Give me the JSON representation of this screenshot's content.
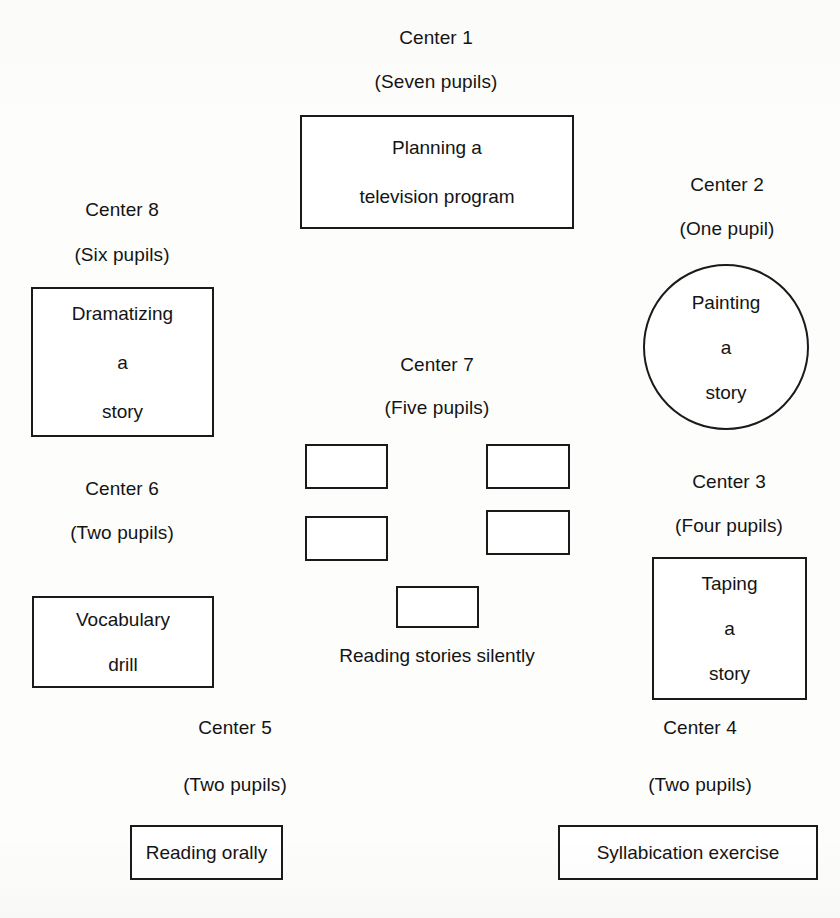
{
  "diagram": {
    "type": "floor-plan-diagram",
    "background_color": "#fdfdfc",
    "line_color": "#1a1a1a",
    "text_color": "#141414"
  },
  "centers": [
    {
      "id": "center-1",
      "label": "Center 1",
      "pupils": "(Seven pupils)",
      "shape": "rectangle",
      "activity_lines": [
        "Planning a",
        "television program"
      ]
    },
    {
      "id": "center-2",
      "label": "Center 2",
      "pupils": "(One pupil)",
      "shape": "circle",
      "activity_lines": [
        "Painting",
        "a",
        "story"
      ]
    },
    {
      "id": "center-3",
      "label": "Center 3",
      "pupils": "(Four pupils)",
      "shape": "rectangle",
      "activity_lines": [
        "Taping",
        "a",
        "story"
      ]
    },
    {
      "id": "center-4",
      "label": "Center 4",
      "pupils": "(Two pupils)",
      "shape": "rectangle",
      "activity_lines": [
        "Syllabication exercise"
      ]
    },
    {
      "id": "center-5",
      "label": "Center 5",
      "pupils": "(Two pupils)",
      "shape": "rectangle",
      "activity_lines": [
        "Reading orally"
      ]
    },
    {
      "id": "center-6",
      "label": "Center 6",
      "pupils": "(Two pupils)",
      "shape": "rectangle",
      "activity_lines": [
        "Vocabulary",
        "drill"
      ]
    },
    {
      "id": "center-7",
      "label": "Center 7",
      "pupils": "(Five pupils)",
      "shape": "desk-cluster",
      "seat_count": 5,
      "caption": "Reading stories silently"
    },
    {
      "id": "center-8",
      "label": "Center 8",
      "pupils": "(Six pupils)",
      "shape": "rectangle",
      "activity_lines": [
        "Dramatizing",
        "a",
        "story"
      ]
    }
  ]
}
